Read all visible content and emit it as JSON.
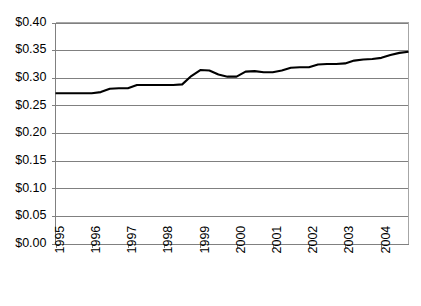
{
  "chart_data": {
    "type": "line",
    "title": "",
    "subtitle": "",
    "xlabel": "",
    "ylabel": "",
    "ylim": [
      0.0,
      0.4
    ],
    "ytick_values": [
      0.0,
      0.05,
      0.1,
      0.15,
      0.2,
      0.25,
      0.3,
      0.35,
      0.4
    ],
    "ytick_labels": [
      "$0.00",
      "$0.05",
      "$0.10",
      "$0.15",
      "$0.20",
      "$0.25",
      "$0.30",
      "$0.35",
      "$0.40"
    ],
    "xlim": [
      1995.0,
      2004.75
    ],
    "xtick_values": [
      1995,
      1996,
      1997,
      1998,
      1999,
      2000,
      2001,
      2002,
      2003,
      2004
    ],
    "xtick_labels": [
      "1995",
      "1996",
      "1997",
      "1998",
      "1999",
      "2000",
      "2001",
      "2002",
      "2003",
      "2004"
    ],
    "xtick_label_rotation": -90,
    "grid": "horizontal",
    "legend": "none",
    "line_color": "#000000",
    "gridline_color": "#808080",
    "background_color": "#FFFFFF",
    "series": [
      {
        "name": "price",
        "x": [
          1995.0,
          1995.25,
          1995.5,
          1995.75,
          1996.0,
          1996.25,
          1996.5,
          1996.75,
          1997.0,
          1997.25,
          1997.5,
          1997.75,
          1998.0,
          1998.25,
          1998.5,
          1998.75,
          1999.0,
          1999.25,
          1999.5,
          1999.75,
          2000.0,
          2000.25,
          2000.5,
          2000.75,
          2001.0,
          2001.25,
          2001.5,
          2001.75,
          2002.0,
          2002.25,
          2002.5,
          2002.75,
          2003.0,
          2003.25,
          2003.5,
          2003.75,
          2004.0,
          2004.25,
          2004.5,
          2004.75
        ],
        "values": [
          0.272,
          0.272,
          0.272,
          0.272,
          0.272,
          0.274,
          0.28,
          0.281,
          0.281,
          0.287,
          0.287,
          0.287,
          0.287,
          0.287,
          0.288,
          0.303,
          0.314,
          0.313,
          0.306,
          0.302,
          0.302,
          0.311,
          0.312,
          0.31,
          0.31,
          0.313,
          0.318,
          0.319,
          0.319,
          0.324,
          0.325,
          0.325,
          0.326,
          0.331,
          0.333,
          0.334,
          0.336,
          0.341,
          0.345,
          0.347
        ]
      }
    ]
  }
}
